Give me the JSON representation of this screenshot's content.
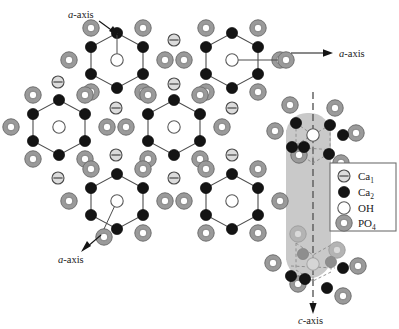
{
  "figure": {
    "background_color": "#ffffff"
  },
  "colors": {
    "ca1_fill": "#d8d8d8",
    "ca1_stroke": "#4a4a4a",
    "ca2_fill": "#151515",
    "ca2_stroke": "#000000",
    "oh_fill": "#ffffff",
    "oh_stroke": "#555555",
    "po4_outer": "#9a9a9a",
    "po4_inner": "#ffffff",
    "po4_stroke": "#6f6f6f",
    "bond_stroke": "#4d4d4d",
    "column_fill": "#c9c9c9",
    "dashed_axis": "#6a6a6a",
    "legend_border": "#6f6f6f",
    "text": "#1a1a1a"
  },
  "axes": [
    {
      "id": "a-axis-top-left",
      "label_prefix": "a",
      "label_suffix": "-axis",
      "x": 70,
      "y": 16,
      "arrow_from": [
        98,
        20
      ],
      "arrow_to": [
        118,
        34
      ]
    },
    {
      "id": "a-axis-right",
      "label_prefix": "a",
      "label_suffix": "-axis",
      "x": 340,
      "y": 57,
      "arrow_from": [
        288,
        53
      ],
      "arrow_to": [
        330,
        53
      ]
    },
    {
      "id": "a-axis-bottom-left",
      "label_prefix": "a",
      "label_suffix": "-axis",
      "x": 60,
      "y": 257,
      "arrow_from": [
        104,
        237
      ],
      "arrow_to": [
        83,
        250
      ]
    },
    {
      "id": "c-axis-bottom",
      "label_prefix": "c",
      "label_suffix": "-axis",
      "x": 300,
      "y": 322,
      "arrow_from": [
        313,
        290
      ],
      "arrow_to": [
        313,
        312
      ]
    }
  ],
  "legend": {
    "box": {
      "x": 330,
      "y": 163,
      "width": 66,
      "height": 68
    },
    "items": [
      {
        "symbol": "ca1-marker",
        "label": "Ca",
        "subscript": "1"
      },
      {
        "symbol": "ca2-marker",
        "label": "Ca",
        "subscript": "2"
      },
      {
        "symbol": "oh-marker",
        "label": "OH",
        "subscript": ""
      },
      {
        "symbol": "po4-marker",
        "label": "PO",
        "subscript": "4"
      }
    ]
  },
  "structure": {
    "hexagon_units": [
      {
        "id": "hex-top-left",
        "cx": 117,
        "cy": 60
      },
      {
        "id": "hex-top-right",
        "cx": 232,
        "cy": 60
      },
      {
        "id": "hex-mid-left",
        "cx": 59,
        "cy": 127
      },
      {
        "id": "hex-mid-center",
        "cx": 174,
        "cy": 127
      },
      {
        "id": "hex-bottom-left",
        "cx": 117,
        "cy": 201
      },
      {
        "id": "hex-bottom-right",
        "cx": 232,
        "cy": 201
      }
    ],
    "hex_radius_x": 26,
    "hex_radius_y": 27,
    "ca1_sites": [
      {
        "x": 170,
        "y": 43
      },
      {
        "x": 170,
        "y": 83
      },
      {
        "x": 58,
        "y": 82
      },
      {
        "x": 172,
        "y": 109
      },
      {
        "x": 116,
        "y": 109
      },
      {
        "x": 116,
        "y": 155
      },
      {
        "x": 231,
        "y": 109
      },
      {
        "x": 231,
        "y": 155
      },
      {
        "x": 170,
        "y": 177
      },
      {
        "x": 58,
        "y": 178
      },
      {
        "x": 170,
        "y": 218
      }
    ],
    "po4_radius": 8.2,
    "ca2_radius": 5.6,
    "oh_radius": 6.2,
    "ca1_radius": 6.0,
    "column": {
      "id": "c-axis-column",
      "x": 286,
      "y": 113,
      "width": 45,
      "height": 165,
      "corner_radius": 20,
      "axis_line_x": 313,
      "axis_line_top": 92,
      "axis_line_bottom": 312
    }
  }
}
